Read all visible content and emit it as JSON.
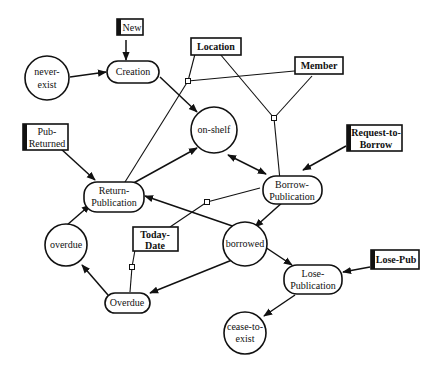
{
  "diagram": {
    "states": [
      {
        "id": "never-exist",
        "label": [
          "never-",
          "exist"
        ]
      },
      {
        "id": "on-shelf",
        "label": [
          "on-shelf"
        ]
      },
      {
        "id": "overdue",
        "label": [
          "overdue"
        ]
      },
      {
        "id": "borrowed",
        "label": [
          "borrowed"
        ]
      },
      {
        "id": "cease-to-exist",
        "label": [
          "cease-to-",
          "exist"
        ]
      }
    ],
    "events": [
      {
        "id": "creation",
        "label": [
          "Creation"
        ]
      },
      {
        "id": "return-publication",
        "label": [
          "Return-",
          "Publication"
        ]
      },
      {
        "id": "borrow-publication",
        "label": [
          "Borrow-",
          "Publication"
        ]
      },
      {
        "id": "overdue-event",
        "label": [
          "Overdue"
        ]
      },
      {
        "id": "lose-publication",
        "label": [
          "Lose-",
          "Publication"
        ]
      }
    ],
    "external_triggers": [
      {
        "id": "new",
        "label": [
          "New"
        ]
      },
      {
        "id": "pub-returned",
        "label": [
          "Pub-",
          "Returned"
        ]
      },
      {
        "id": "request-to-borrow",
        "label": [
          "Request-to-",
          "Borrow"
        ]
      },
      {
        "id": "lose-pub",
        "label": [
          "Lose-Pub"
        ]
      }
    ],
    "entities": [
      {
        "id": "location",
        "label": [
          "Location"
        ]
      },
      {
        "id": "member",
        "label": [
          "Member"
        ]
      },
      {
        "id": "today-date",
        "label": [
          "Today-",
          "Date"
        ]
      }
    ],
    "transitions": [
      {
        "from": "never-exist",
        "to": "creation"
      },
      {
        "from": "new",
        "to": "creation"
      },
      {
        "from": "creation",
        "to": "on-shelf"
      },
      {
        "from": "return-publication",
        "to": "on-shelf"
      },
      {
        "from": "on-shelf",
        "to": "borrow-publication",
        "bidirectional": true
      },
      {
        "from": "request-to-borrow",
        "to": "borrow-publication"
      },
      {
        "from": "pub-returned",
        "to": "return-publication"
      },
      {
        "from": "borrow-publication",
        "to": "borrowed"
      },
      {
        "from": "borrowed",
        "to": "return-publication"
      },
      {
        "from": "borrowed",
        "to": "overdue-event"
      },
      {
        "from": "borrowed",
        "to": "lose-publication"
      },
      {
        "from": "overdue-event",
        "to": "overdue"
      },
      {
        "from": "overdue",
        "to": "return-publication"
      },
      {
        "from": "lose-pub",
        "to": "lose-publication"
      },
      {
        "from": "lose-publication",
        "to": "cease-to-exist"
      }
    ]
  }
}
